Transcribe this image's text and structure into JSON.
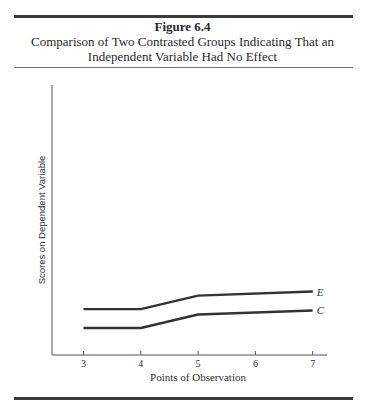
{
  "figure": {
    "number": "Figure 6.4",
    "title_line1": "Comparison of Two Contrasted Groups Indicating That an",
    "title_line2": "Independent Variable Had No Effect"
  },
  "chart_data": {
    "type": "line",
    "title": "Comparison of Two Contrasted Groups Indicating That an Independent Variable Had No Effect",
    "xlabel": "Points of Observation",
    "ylabel": "Scores on Dependent Variable",
    "x": [
      3,
      4,
      5,
      6,
      7
    ],
    "x_tick_labels": [
      "3",
      "4",
      "5",
      "6",
      "7"
    ],
    "y_ticks": [],
    "grid": false,
    "legend": "inline labels at line ends",
    "series": [
      {
        "name": "E",
        "x": [
          3,
          4,
          5,
          7
        ],
        "values": [
          1.7,
          1.7,
          2.2,
          2.35
        ]
      },
      {
        "name": "C",
        "x": [
          3,
          4,
          5,
          7
        ],
        "values": [
          1.0,
          1.0,
          1.5,
          1.65
        ]
      }
    ],
    "ylim": [
      0,
      10
    ],
    "xlim": [
      2.45,
      7.25
    ]
  }
}
